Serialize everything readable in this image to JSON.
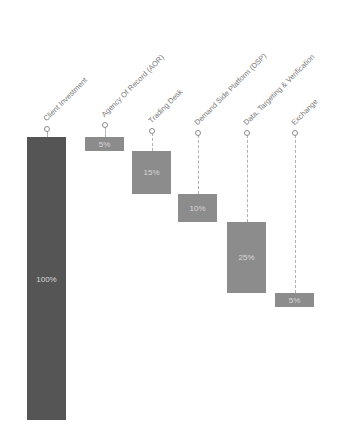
{
  "chart_data": {
    "type": "bar",
    "subtype": "waterfall",
    "title": "",
    "xlabel": "",
    "ylabel": "",
    "ylim": [
      0,
      100
    ],
    "grid": false,
    "legend": null,
    "categories": [
      "Client Investment",
      "Agency Of Record (AOR)",
      "Trading Desk",
      "Demand Side Platform (DSP)",
      "Data, Targeting & Verification",
      "Exchange"
    ],
    "values": [
      100,
      5,
      15,
      10,
      25,
      5
    ],
    "labels": [
      "100%",
      "5%",
      "15%",
      "10%",
      "25%",
      "5%"
    ],
    "colors": {
      "total": "#555555",
      "step": "#8c8c8c",
      "label_text": "#d8d8d8",
      "category_text": "#7a7a7a"
    }
  }
}
